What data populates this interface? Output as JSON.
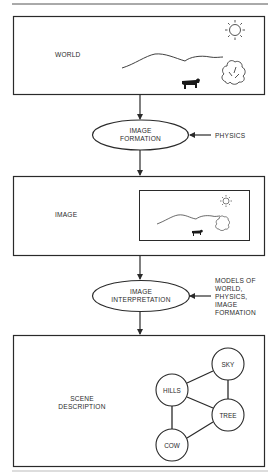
{
  "colors": {
    "ink": "#2a2a2a",
    "paper": "#ffffff",
    "rule": "#555555"
  },
  "boxes": {
    "world": {
      "label": "WORLD"
    },
    "image": {
      "label": "IMAGE"
    },
    "scene": {
      "label_line1": "SCENE",
      "label_line2": "DESCRIPTION"
    }
  },
  "processes": {
    "formation": {
      "line1": "IMAGE",
      "line2": "FORMATION",
      "input": "PHYSICS"
    },
    "interpretation": {
      "line1": "IMAGE",
      "line2": "INTERPRETATION",
      "input_lines": [
        "MODELS OF",
        "WORLD,",
        "PHYSICS,",
        "IMAGE",
        "FORMATION"
      ]
    }
  },
  "scene_graph": {
    "nodes": [
      {
        "id": "sky",
        "label": "SKY"
      },
      {
        "id": "hills",
        "label": "HILLS"
      },
      {
        "id": "tree",
        "label": "TREE"
      },
      {
        "id": "cow",
        "label": "COW"
      }
    ],
    "edges": [
      [
        "hills",
        "sky"
      ],
      [
        "sky",
        "tree"
      ],
      [
        "hills",
        "tree"
      ],
      [
        "hills",
        "cow"
      ],
      [
        "cow",
        "tree"
      ]
    ]
  },
  "icons": [
    "sun-icon",
    "hills-icon",
    "tree-icon",
    "cow-icon"
  ]
}
